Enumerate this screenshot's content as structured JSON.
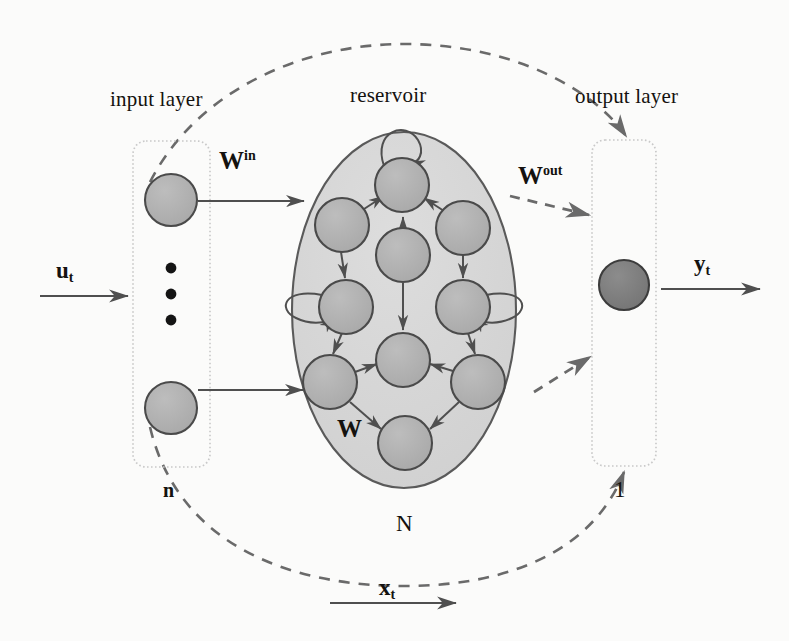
{
  "figure": {
    "labels": {
      "input_layer": "input layer",
      "reservoir": "reservoir",
      "output_layer": "output layer",
      "w_in_base": "W",
      "w_in_sup": "in",
      "w_out_base": "W",
      "w_out_sup": "out",
      "w_recurrent": "W",
      "input_count": "n",
      "reservoir_count": "N",
      "output_count": "1",
      "input_signal_base": "u",
      "input_signal_sub": "t",
      "output_signal_base": "y",
      "output_signal_sub": "t",
      "state_signal_base": "x",
      "state_signal_sub": "t"
    },
    "colors": {
      "node_fill": "#b0b0b0",
      "node_stroke": "#4a4a4a",
      "reservoir_fill": "#d6d6d6",
      "reservoir_stroke": "#5a5a5a",
      "output_node_fill": "#7d7d7d",
      "output_node_stroke": "#3c3c3c",
      "box_stroke": "#c9c9c9",
      "edge_stroke": "#4f4f4f",
      "dashed_stroke": "#6a6a6a",
      "text": "#14120f",
      "page_bg": "#fbfbfa"
    },
    "input_layer_nodes": [
      {
        "cx": 171,
        "cy": 200,
        "r": 26
      },
      {
        "cx": 171,
        "cy": 408,
        "r": 26
      }
    ],
    "input_layer_ellipsis_dots": [
      {
        "cx": 171,
        "cy": 268,
        "r": 5
      },
      {
        "cx": 171,
        "cy": 294,
        "r": 5
      },
      {
        "cx": 171,
        "cy": 320,
        "r": 5
      }
    ],
    "output_layer_nodes": [
      {
        "cx": 624,
        "cy": 285,
        "r": 25
      }
    ],
    "reservoir_nodes": [
      {
        "id": "r1",
        "cx": 402,
        "cy": 185,
        "r": 27
      },
      {
        "id": "r2",
        "cx": 342,
        "cy": 225,
        "r": 27
      },
      {
        "id": "r3",
        "cx": 463,
        "cy": 228,
        "r": 27
      },
      {
        "id": "r4",
        "cx": 403,
        "cy": 255,
        "r": 27
      },
      {
        "id": "r5",
        "cx": 346,
        "cy": 307,
        "r": 27
      },
      {
        "id": "r6",
        "cx": 463,
        "cy": 307,
        "r": 27
      },
      {
        "id": "r7",
        "cx": 403,
        "cy": 360,
        "r": 27
      },
      {
        "id": "r8",
        "cx": 330,
        "cy": 382,
        "r": 27
      },
      {
        "id": "r9",
        "cx": 478,
        "cy": 382,
        "r": 27
      },
      {
        "id": "r10",
        "cx": 405,
        "cy": 443,
        "r": 27
      }
    ],
    "reservoir_ellipse": {
      "cx": 404,
      "cy": 310,
      "rx": 112,
      "ry": 178
    },
    "input_box": {
      "x": 133,
      "y": 141,
      "w": 77,
      "h": 326
    },
    "output_box": {
      "x": 592,
      "y": 140,
      "w": 64,
      "h": 326
    }
  }
}
